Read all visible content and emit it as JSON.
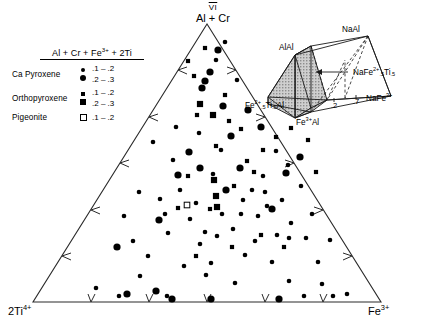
{
  "figure": {
    "type": "ternary-scatter",
    "apex_top": {
      "roman": "VI",
      "formula": "Al + Cr"
    },
    "vertex_bottom_left": "2Ti",
    "vertex_bottom_left_charge": "4+",
    "vertex_bottom_right": "Fe",
    "vertex_bottom_right_charge": "3+"
  },
  "legend": {
    "title_parts": {
      "a": "Al + Cr + Fe",
      "sup": "3+",
      "b": " + 2Ti"
    },
    "entries": [
      {
        "name": "Ca Pyroxene",
        "symbol": "filled-circle",
        "rows": [
          {
            "symbol": "small-filled-circle",
            "range": ".1 – .2"
          },
          {
            "symbol": "large-filled-circle",
            "range": ".2 – .3"
          }
        ]
      },
      {
        "name": "Orthopyroxene",
        "symbol": "filled-square",
        "rows": [
          {
            "symbol": "small-filled-square",
            "range": ".1 – .2"
          },
          {
            "symbol": "large-filled-square",
            "range": ".2 – .3"
          }
        ]
      },
      {
        "name": "Pigeonite",
        "symbol": "open-square",
        "rows": [
          {
            "symbol": "open-square",
            "range": ".1 – .2"
          }
        ]
      }
    ]
  },
  "inset": {
    "labels": {
      "al_al": "AlAl",
      "na_al": "NaAl",
      "na_fe_ti": {
        "a": "NaFe",
        "sup": "2+",
        "sub1": ".5",
        "b": "Ti",
        "sub2": ".5"
      },
      "na_fe3": {
        "a": "NaFe",
        "sup": "3+"
      },
      "fe_ti_al": {
        "a": "Fe",
        "sup": "2+",
        "sub1": ".5",
        "b": "Ti",
        "sub2": ".5",
        "c": "Al"
      },
      "fe3_al": {
        "a": "Fe",
        "sup": "3+",
        "b": "Al"
      }
    },
    "ticks": [
      ".2",
      ".7"
    ]
  },
  "chart_data": {
    "type": "scatter",
    "title": "",
    "axes": {
      "top": "VI Al + Cr",
      "bottom_left": "2Ti 4+",
      "bottom_right": "Fe 3+"
    },
    "grid": false,
    "tick_count_per_edge": 5,
    "series": [
      {
        "name": "Ca Pyroxene .1-.2",
        "symbol": "small-filled-circle",
        "points": [
          [
            225,
            42
          ],
          [
            216,
            60
          ],
          [
            237,
            80
          ],
          [
            176,
            127
          ],
          [
            199,
            133
          ],
          [
            153,
            142
          ],
          [
            173,
            160
          ],
          [
            221,
            150
          ],
          [
            213,
            174
          ],
          [
            180,
            190
          ],
          [
            139,
            192
          ],
          [
            160,
            199
          ],
          [
            196,
            203
          ],
          [
            243,
            200
          ],
          [
            263,
            176
          ],
          [
            276,
            151
          ],
          [
            233,
            229
          ],
          [
            258,
            216
          ],
          [
            282,
            200
          ],
          [
            289,
            238
          ],
          [
            168,
            233
          ],
          [
            200,
            244
          ],
          [
            148,
            256
          ],
          [
            124,
            216
          ],
          [
            301,
            186
          ],
          [
            312,
            214
          ],
          [
            245,
            255
          ],
          [
            272,
            262
          ],
          [
            206,
            275
          ],
          [
            318,
            262
          ],
          [
            235,
            283
          ],
          [
            289,
            281
          ],
          [
            322,
            284
          ],
          [
            333,
            296
          ],
          [
            347,
            294
          ],
          [
            304,
            296
          ],
          [
            119,
            296
          ],
          [
            167,
            296
          ],
          [
            96,
            288
          ],
          [
            140,
            276
          ],
          [
            184,
            266
          ],
          [
            211,
            263
          ],
          [
            255,
            241
          ],
          [
            291,
            223
          ],
          [
            267,
            206
          ],
          [
            222,
            214
          ],
          [
            190,
            219
          ],
          [
            165,
            214
          ],
          [
            133,
            241
          ],
          [
            252,
            190
          ],
          [
            217,
            236
          ],
          [
            277,
            235
          ],
          [
            241,
            214
          ],
          [
            205,
            232
          ],
          [
            306,
            238
          ],
          [
            330,
            240
          ],
          [
            265,
            192
          ],
          [
            288,
            165
          ]
        ]
      },
      {
        "name": "Ca Pyroxene .2-.3",
        "symbol": "large-filled-circle",
        "points": [
          [
            218,
            50
          ],
          [
            210,
            72
          ],
          [
            205,
            81
          ],
          [
            202,
            88
          ],
          [
            223,
            106
          ],
          [
            248,
            110
          ],
          [
            178,
            175
          ],
          [
            159,
            220
          ],
          [
            200,
            168
          ],
          [
            226,
            190
          ],
          [
            240,
            168
          ],
          [
            272,
            209
          ],
          [
            286,
            173
          ],
          [
            300,
            157
          ],
          [
            117,
            247
          ],
          [
            127,
            294
          ],
          [
            156,
            291
          ],
          [
            172,
            299
          ],
          [
            211,
            299
          ],
          [
            279,
            299
          ],
          [
            261,
            127
          ],
          [
            231,
            136
          ],
          [
            189,
            152
          ]
        ]
      },
      {
        "name": "Orthopyroxene .1-.2",
        "symbol": "small-filled-square",
        "points": [
          [
            205,
            48
          ],
          [
            188,
            61
          ],
          [
            194,
            76
          ],
          [
            225,
            95
          ],
          [
            197,
            115
          ],
          [
            229,
            121
          ],
          [
            241,
            129
          ],
          [
            216,
            146
          ],
          [
            188,
            176
          ],
          [
            234,
            186
          ],
          [
            178,
            208
          ],
          [
            210,
            209
          ],
          [
            254,
            172
          ],
          [
            263,
            150
          ],
          [
            276,
            137
          ],
          [
            291,
            128
          ],
          [
            232,
            247
          ],
          [
            196,
            256
          ],
          [
            308,
            140
          ],
          [
            316,
            172
          ],
          [
            247,
            161
          ],
          [
            261,
            235
          ],
          [
            284,
            247
          ]
        ]
      },
      {
        "name": "Orthopyroxene .2-.3",
        "symbol": "large-filled-square",
        "points": [
          [
            200,
            104
          ],
          [
            213,
            115
          ],
          [
            214,
            180
          ],
          [
            216,
            196
          ],
          [
            217,
            207
          ]
        ]
      },
      {
        "name": "Pigeonite .1-.2",
        "symbol": "open-square",
        "points": [
          [
            277,
            93
          ],
          [
            187,
            205
          ]
        ]
      }
    ],
    "legend_position": "upper-left"
  }
}
